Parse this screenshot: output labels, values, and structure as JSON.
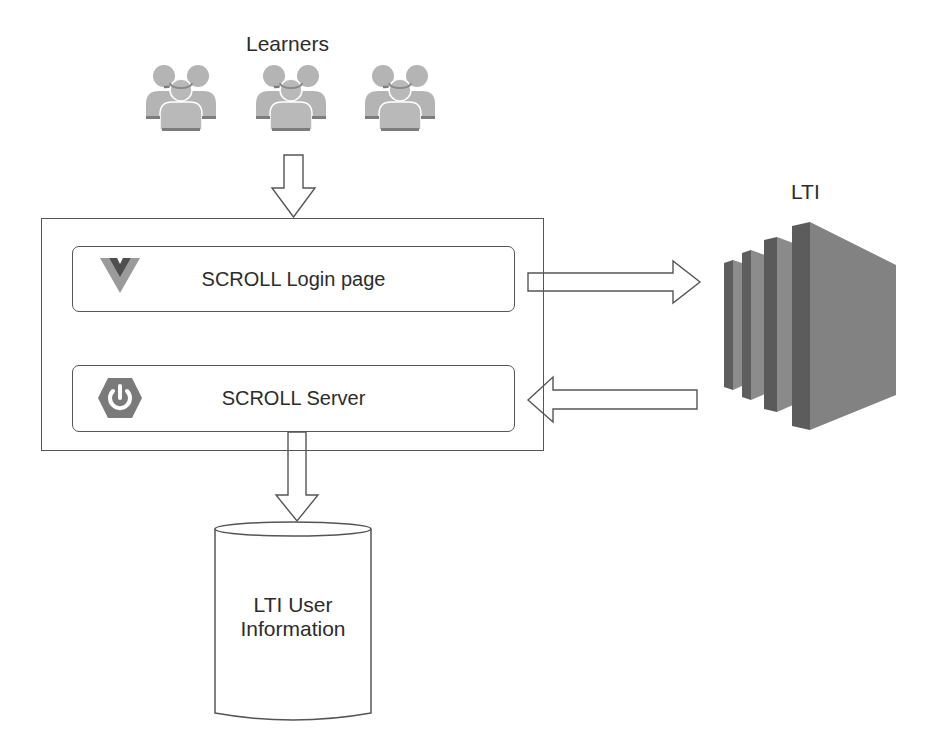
{
  "diagram": {
    "learners": {
      "label": "Learners",
      "icon_count": 3,
      "icon": "user-group-icon"
    },
    "scroll_system": {
      "components": [
        {
          "label": "SCROLL Login page",
          "icon": "vue-logo-icon"
        },
        {
          "label": "SCROLL Server",
          "icon": "power-hexagon-icon"
        }
      ]
    },
    "lti": {
      "label": "LTI",
      "icon": "lti-stacked-panels-icon"
    },
    "database": {
      "label_line1": "LTI User",
      "label_line2": "Information",
      "icon": "database-cylinder-icon"
    },
    "arrows": [
      {
        "from": "Learners",
        "to": "SCROLL system",
        "direction": "down"
      },
      {
        "from": "SCROLL Login page",
        "to": "LTI",
        "direction": "right"
      },
      {
        "from": "LTI",
        "to": "SCROLL Server",
        "direction": "left"
      },
      {
        "from": "SCROLL Server",
        "to": "LTI User Information",
        "direction": "down"
      }
    ],
    "colors": {
      "line": "#555555",
      "icon_gray": "#a9a9a9",
      "icon_gray_dark": "#7a7a7a",
      "lti_dark": "#5e5e5e",
      "lti_mid": "#8a8a8a",
      "lti_face": "#7f7f7f",
      "text": "#2c2c2c"
    }
  }
}
